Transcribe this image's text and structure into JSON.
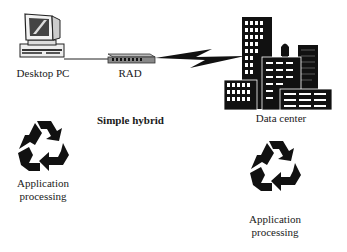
{
  "diagram": {
    "title": "Simple hybrid",
    "nodes": {
      "desktop_pc": {
        "label": "Desktop PC",
        "icon": "desktop-computer-icon"
      },
      "rad": {
        "label": "RAD",
        "icon": "network-device-icon"
      },
      "data_center": {
        "label": "Data center",
        "icon": "city-buildings-icon"
      }
    },
    "processing": {
      "left": {
        "line1": "Application",
        "line2": "processing",
        "icon": "recycle-arrows-icon"
      },
      "right": {
        "line1": "Application",
        "line2": "processing",
        "icon": "recycle-arrows-icon"
      }
    },
    "links": [
      {
        "from": "Desktop PC",
        "to": "RAD",
        "type": "cable"
      },
      {
        "from": "RAD",
        "to": "Data center",
        "type": "wireless-lightning"
      }
    ]
  }
}
